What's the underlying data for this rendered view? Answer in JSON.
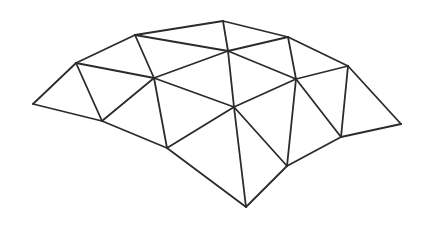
{
  "diagram": {
    "type": "triangulated-mesh",
    "stroke_color": "#2b2b2b",
    "stroke_width": 1.8,
    "background": "#ffffff",
    "vertices": {
      "A": [
        33,
        104
      ],
      "B": [
        76,
        63
      ],
      "C": [
        135,
        35
      ],
      "D": [
        223,
        21
      ],
      "E": [
        288,
        37
      ],
      "F": [
        348,
        66
      ],
      "G": [
        401,
        124
      ],
      "H": [
        341,
        137
      ],
      "I": [
        287,
        166
      ],
      "J": [
        246,
        207
      ],
      "K": [
        167,
        148
      ],
      "L": [
        102,
        121
      ],
      "M": [
        154,
        78
      ],
      "N": [
        228,
        51
      ],
      "O": [
        234,
        107
      ],
      "P": [
        296,
        79
      ]
    },
    "edges": [
      [
        "A",
        "B"
      ],
      [
        "A",
        "L"
      ],
      [
        "B",
        "L"
      ],
      [
        "B",
        "C"
      ],
      [
        "B",
        "M"
      ],
      [
        "C",
        "M"
      ],
      [
        "C",
        "D"
      ],
      [
        "C",
        "N"
      ],
      [
        "D",
        "N"
      ],
      [
        "D",
        "E"
      ],
      [
        "N",
        "E"
      ],
      [
        "N",
        "M"
      ],
      [
        "N",
        "P"
      ],
      [
        "N",
        "O"
      ],
      [
        "E",
        "P"
      ],
      [
        "E",
        "F"
      ],
      [
        "F",
        "P"
      ],
      [
        "F",
        "H"
      ],
      [
        "F",
        "G"
      ],
      [
        "G",
        "H"
      ],
      [
        "H",
        "P"
      ],
      [
        "H",
        "I"
      ],
      [
        "P",
        "I"
      ],
      [
        "P",
        "O"
      ],
      [
        "O",
        "I"
      ],
      [
        "O",
        "J"
      ],
      [
        "O",
        "K"
      ],
      [
        "M",
        "O"
      ],
      [
        "M",
        "K"
      ],
      [
        "M",
        "L"
      ],
      [
        "I",
        "J"
      ],
      [
        "J",
        "K"
      ],
      [
        "K",
        "L"
      ]
    ]
  }
}
